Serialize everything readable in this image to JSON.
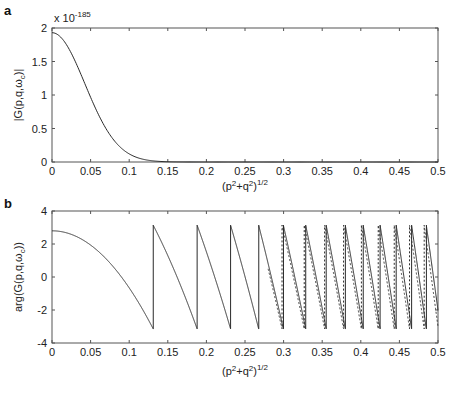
{
  "chart_data": [
    {
      "panel": "a",
      "type": "line",
      "title": "",
      "xlabel": "(p²+q²)^1/2",
      "ylabel": "|G(p,q,ω_c)|",
      "y_scale_note": "x 10^-185",
      "xlim": [
        0,
        0.5
      ],
      "ylim": [
        0,
        2
      ],
      "xticks": [
        0,
        0.05,
        0.1,
        0.15,
        0.2,
        0.25,
        0.3,
        0.35,
        0.4,
        0.45,
        0.5
      ],
      "xtick_labels": [
        "0",
        "0.05",
        "0.1",
        "0.15",
        "0.2",
        "0.25",
        "0.3",
        "0.35",
        "0.4",
        "0.45",
        "0.5"
      ],
      "yticks": [
        0,
        0.5,
        1,
        1.5,
        2
      ],
      "ytick_labels": [
        "0",
        "0.5",
        "1",
        "1.5",
        "2"
      ],
      "grid": false,
      "series": [
        {
          "name": "magnitude",
          "style": "solid",
          "model": "gaussian",
          "peak": 1.93,
          "sigma": 0.0425,
          "x": [
            0,
            0.025,
            0.05,
            0.075,
            0.1,
            0.125,
            0.15,
            0.175,
            0.2,
            0.3,
            0.4,
            0.5
          ],
          "values": [
            1.93,
            1.62,
            0.96,
            0.4,
            0.12,
            0.03,
            0.004,
            0.0,
            0.0,
            0.0,
            0.0,
            0.0
          ]
        }
      ]
    },
    {
      "panel": "b",
      "type": "line",
      "title": "",
      "xlabel": "(p²+q²)^1/2",
      "ylabel": "arg(G(p,q,ω_c))",
      "xlim": [
        0,
        0.5
      ],
      "ylim": [
        -4,
        4
      ],
      "xticks": [
        0,
        0.05,
        0.1,
        0.15,
        0.2,
        0.25,
        0.3,
        0.35,
        0.4,
        0.45,
        0.5
      ],
      "xtick_labels": [
        "0",
        "0.05",
        "0.1",
        "0.15",
        "0.2",
        "0.25",
        "0.3",
        "0.35",
        "0.4",
        "0.45",
        "0.5"
      ],
      "yticks": [
        -4,
        -2,
        0,
        2,
        4
      ],
      "ytick_labels": [
        "-4",
        "-2",
        "0",
        "2",
        "4"
      ],
      "grid": false,
      "series": [
        {
          "name": "phase (solid)",
          "style": "solid",
          "model": "wrapped_quadratic",
          "phi0": 2.8,
          "c": 346,
          "wrap_x": [
            0.131,
            0.185,
            0.231,
            0.266,
            0.298,
            0.326,
            0.352,
            0.377,
            0.4,
            0.422,
            0.443,
            0.464,
            0.482,
            0.499
          ]
        },
        {
          "name": "phase (dashed)",
          "style": "dashed",
          "model": "wrapped_quadratic",
          "phi0": 2.8,
          "c": 350,
          "x_start": 0.28
        }
      ]
    }
  ],
  "panels": {
    "a": {
      "letter": "a",
      "exponent_prefix": "x 10",
      "exponent": "-185",
      "ylabel": "|G(p,q,ω",
      "ylabel_sub": "c",
      "ylabel_end": ")|",
      "xlabel_base": "(p",
      "xlabel_sup1": "2",
      "xlabel_mid": "+q",
      "xlabel_sup2": "2",
      "xlabel_end": ")",
      "xlabel_sup3": "1/2"
    },
    "b": {
      "letter": "b",
      "ylabel": "arg(G(p,q,ω",
      "ylabel_sub": "c",
      "ylabel_end": "))",
      "xlabel_base": "(p",
      "xlabel_sup1": "2",
      "xlabel_mid": "+q",
      "xlabel_sup2": "2",
      "xlabel_end": ")",
      "xlabel_sup3": "1/2"
    }
  },
  "colors": {
    "line": "#2a2a2a",
    "axis": "#555555",
    "background": "#ffffff"
  }
}
